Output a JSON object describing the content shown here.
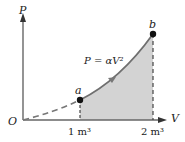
{
  "diagram": {
    "type": "pv-diagram",
    "axes": {
      "y_label": "P",
      "x_label": "V",
      "origin_label": "O"
    },
    "ticks": [
      {
        "label": "1 m³",
        "value": 1
      },
      {
        "label": "2 m³",
        "value": 2
      }
    ],
    "points": [
      {
        "label": "a",
        "V": 1
      },
      {
        "label": "b",
        "V": 2
      }
    ],
    "equation": "P = αV²",
    "colors": {
      "curve": "#6f6f6f",
      "shade": "#d3d3d3",
      "axis": "#555555",
      "point": "#111111",
      "dashed": "#444444"
    }
  }
}
